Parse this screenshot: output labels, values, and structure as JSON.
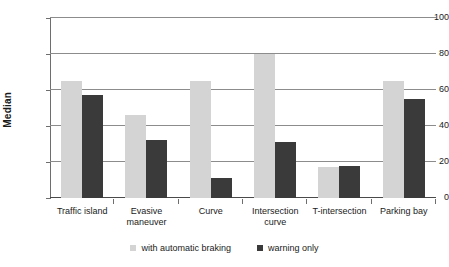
{
  "chart_data": {
    "type": "bar",
    "title": "",
    "xlabel": "",
    "ylabel": "Median",
    "ylim": [
      0,
      100
    ],
    "yticks": [
      0,
      20,
      40,
      60,
      80,
      100
    ],
    "ytick_labels": [
      "0",
      "20",
      "40",
      "60",
      "80",
      "100"
    ],
    "grid": true,
    "legend_position": "bottom",
    "categories": [
      "Traffic island",
      "Evasive maneuver",
      "Curve",
      "Intersection curve",
      "T-intersection",
      "Parking bay"
    ],
    "category_lines": [
      [
        "Traffic island"
      ],
      [
        "Evasive",
        "maneuver"
      ],
      [
        "Curve"
      ],
      [
        "Intersection",
        "curve"
      ],
      [
        "T-intersection"
      ],
      [
        "Parking bay"
      ]
    ],
    "series": [
      {
        "name": "with automatic braking",
        "color": "#d4d4d4",
        "values": [
          65,
          46,
          65,
          80,
          17,
          65
        ]
      },
      {
        "name": "warning only",
        "color": "#3a3a3a",
        "values": [
          57,
          32,
          11,
          31,
          18,
          55
        ]
      }
    ]
  },
  "axis": {
    "y_title": "Median"
  },
  "legend": {
    "items": [
      {
        "label": "with automatic braking",
        "swatch": "series-a"
      },
      {
        "label": "warning only",
        "swatch": "series-b"
      }
    ]
  }
}
